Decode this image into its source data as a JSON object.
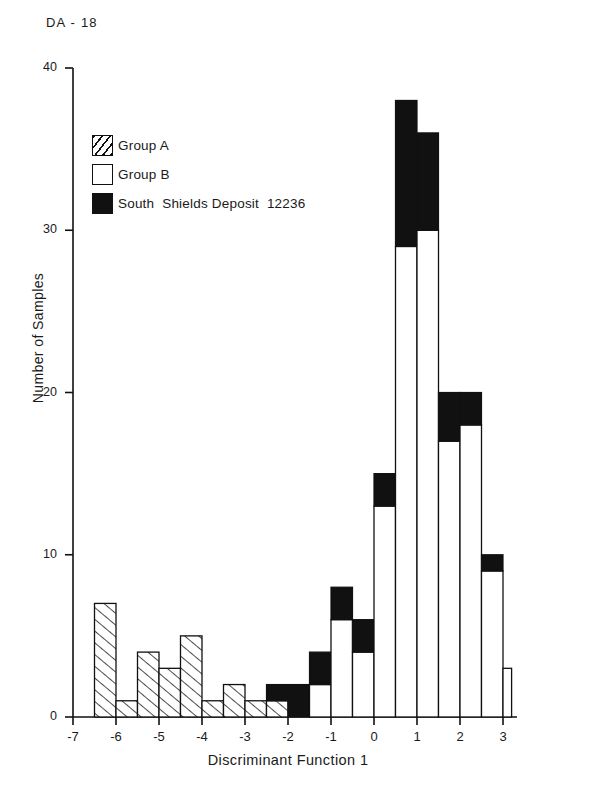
{
  "figure": {
    "corner_label": "DA - 18"
  },
  "legend": {
    "items": [
      {
        "label": "Group A",
        "style": "hatched",
        "name": "legend-group-a"
      },
      {
        "label": "Group B",
        "style": "white",
        "name": "legend-group-b"
      },
      {
        "label": "South  Shields Deposit  12236",
        "style": "black",
        "name": "legend-south-shields"
      }
    ]
  },
  "chart_data": {
    "type": "bar",
    "subtype": "stacked-histogram",
    "title": "",
    "xlabel": "Discriminant Function 1",
    "ylabel": "Number of Samples",
    "xlim": [
      -7,
      3.2
    ],
    "ylim": [
      0,
      40
    ],
    "xticks": [
      -7,
      -6,
      -5,
      -4,
      -3,
      -2,
      -1,
      0,
      1,
      2,
      3
    ],
    "xtick_labels": [
      "-7",
      "-6",
      "-5",
      "-4",
      "-3",
      "-2",
      "-1",
      "0",
      "1",
      "2",
      "3"
    ],
    "yticks": [
      0,
      10,
      20,
      30,
      40
    ],
    "ytick_labels": [
      "0",
      "10",
      "20",
      "30",
      "40"
    ],
    "grid": false,
    "legend_position": "upper-left",
    "bin_width": 0.5,
    "series": [
      {
        "name": "Group A",
        "style": "hatched",
        "color": "#ffffff"
      },
      {
        "name": "Group B",
        "style": "white",
        "color": "#ffffff"
      },
      {
        "name": "South Shields Deposit 12236",
        "style": "black",
        "color": "#111111"
      }
    ],
    "bins": [
      {
        "x0": -6.5,
        "x1": -6.0,
        "group_a": 7,
        "group_b": 0,
        "south_shields": 0
      },
      {
        "x0": -6.0,
        "x1": -5.5,
        "group_a": 1,
        "group_b": 0,
        "south_shields": 0
      },
      {
        "x0": -5.5,
        "x1": -5.0,
        "group_a": 4,
        "group_b": 0,
        "south_shields": 0
      },
      {
        "x0": -5.0,
        "x1": -4.5,
        "group_a": 3,
        "group_b": 0,
        "south_shields": 0
      },
      {
        "x0": -4.5,
        "x1": -4.0,
        "group_a": 5,
        "group_b": 0,
        "south_shields": 0
      },
      {
        "x0": -4.0,
        "x1": -3.5,
        "group_a": 1,
        "group_b": 0,
        "south_shields": 0
      },
      {
        "x0": -3.5,
        "x1": -3.0,
        "group_a": 2,
        "group_b": 0,
        "south_shields": 0
      },
      {
        "x0": -3.0,
        "x1": -2.5,
        "group_a": 1,
        "group_b": 0,
        "south_shields": 0
      },
      {
        "x0": -2.5,
        "x1": -2.0,
        "group_a": 1,
        "group_b": 0,
        "south_shields": 1
      },
      {
        "x0": -2.0,
        "x1": -1.5,
        "group_a": 0,
        "group_b": 0,
        "south_shields": 2
      },
      {
        "x0": -1.5,
        "x1": -1.0,
        "group_a": 0,
        "group_b": 2,
        "south_shields": 2
      },
      {
        "x0": -1.0,
        "x1": -0.5,
        "group_a": 0,
        "group_b": 6,
        "south_shields": 2
      },
      {
        "x0": -0.5,
        "x1": 0.0,
        "group_a": 0,
        "group_b": 4,
        "south_shields": 2
      },
      {
        "x0": 0.0,
        "x1": 0.5,
        "group_a": 0,
        "group_b": 13,
        "south_shields": 2
      },
      {
        "x0": 0.5,
        "x1": 1.0,
        "group_a": 0,
        "group_b": 29,
        "south_shields": 9
      },
      {
        "x0": 1.0,
        "x1": 1.5,
        "group_a": 0,
        "group_b": 30,
        "south_shields": 6
      },
      {
        "x0": 1.5,
        "x1": 2.0,
        "group_a": 0,
        "group_b": 17,
        "south_shields": 3
      },
      {
        "x0": 2.0,
        "x1": 2.5,
        "group_a": 0,
        "group_b": 18,
        "south_shields": 2
      },
      {
        "x0": 2.5,
        "x1": 3.0,
        "group_a": 0,
        "group_b": 9,
        "south_shields": 1
      },
      {
        "x0": 3.0,
        "x1": 3.2,
        "group_a": 0,
        "group_b": 3,
        "south_shields": 0
      }
    ]
  }
}
